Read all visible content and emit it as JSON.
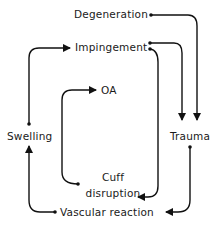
{
  "diagram": {
    "type": "flow-cycle",
    "nodes": [
      {
        "id": "degeneration",
        "label": "Degeneration"
      },
      {
        "id": "impingement",
        "label": "Impingement"
      },
      {
        "id": "oa",
        "label": "OA"
      },
      {
        "id": "swelling",
        "label": "Swelling"
      },
      {
        "id": "trauma",
        "label": "Trauma"
      },
      {
        "id": "cuff_disruption",
        "label_line1": "Cuff",
        "label_line2": "disruption"
      },
      {
        "id": "vascular_reaction",
        "label": "Vascular reaction"
      }
    ],
    "edges": [
      {
        "from": "degeneration",
        "to": "trauma"
      },
      {
        "from": "impingement",
        "to": "trauma"
      },
      {
        "from": "impingement",
        "to": "cuff_disruption"
      },
      {
        "from": "cuff_disruption",
        "to": "oa"
      },
      {
        "from": "swelling",
        "to": "impingement"
      },
      {
        "from": "trauma",
        "to": "vascular_reaction"
      },
      {
        "from": "vascular_reaction",
        "to": "swelling"
      }
    ],
    "colors": {
      "line": "#111111",
      "text": "#1a1a1a",
      "background": "#ffffff"
    }
  }
}
